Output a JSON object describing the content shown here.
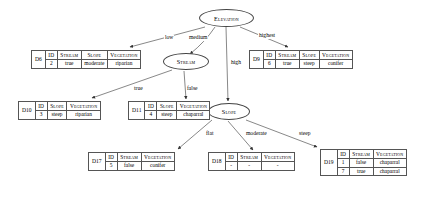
{
  "diagram": {
    "type": "decision-tree",
    "nodes": {
      "root": {
        "label": "Elevation",
        "shape": "ellipse"
      },
      "stream": {
        "label": "Stream",
        "shape": "ellipse"
      },
      "slope": {
        "label": "Slope",
        "shape": "ellipse"
      }
    },
    "edge_labels": {
      "low": "low",
      "medium": "medium",
      "high": "high",
      "highest": "highest",
      "stream_true": "true",
      "stream_false": "false",
      "slope_flat": "flat",
      "slope_moderate": "moderate",
      "slope_steep": "steep"
    },
    "tables": {
      "d6": {
        "name": "D6",
        "headers": [
          "ID",
          "Stream",
          "Slope",
          "Vegetation"
        ],
        "rows": [
          [
            "2",
            "true",
            "moderate",
            "riparian"
          ]
        ]
      },
      "d9": {
        "name": "D9",
        "headers": [
          "ID",
          "Stream",
          "Slope",
          "Vegetation"
        ],
        "rows": [
          [
            "6",
            "true",
            "steep",
            "conifer"
          ]
        ]
      },
      "d10": {
        "name": "D10",
        "headers": [
          "ID",
          "Slope",
          "Vegetation"
        ],
        "rows": [
          [
            "3",
            "steep",
            "riparian"
          ]
        ]
      },
      "d11": {
        "name": "D11",
        "headers": [
          "ID",
          "Slope",
          "Vegetation"
        ],
        "rows": [
          [
            "4",
            "steep",
            "chaparral"
          ]
        ]
      },
      "d17": {
        "name": "D17",
        "headers": [
          "ID",
          "Stream",
          "Vegetation"
        ],
        "rows": [
          [
            "5",
            "false",
            "conifer"
          ]
        ]
      },
      "d18": {
        "name": "D18",
        "headers": [
          "ID",
          "Stream",
          "Vegetation"
        ],
        "rows": [
          [
            "-",
            "-",
            "-"
          ]
        ]
      },
      "d19": {
        "name": "D19",
        "headers": [
          "ID",
          "Stream",
          "Vegetation"
        ],
        "rows": [
          [
            "1",
            "false",
            "chaparral"
          ],
          [
            "7",
            "true",
            "chaparral"
          ]
        ]
      }
    }
  }
}
